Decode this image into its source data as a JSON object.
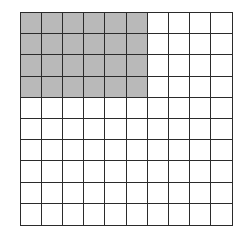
{
  "diagram": {
    "type": "hundred-grid",
    "rows": 10,
    "columns": 10,
    "shaded": {
      "rows": 4,
      "columns": 6,
      "count": 24
    },
    "total_cells": 100,
    "colors": {
      "shaded": "#b9b9b9",
      "unshaded": "#ffffff",
      "lines": "#2b2b2b"
    }
  }
}
